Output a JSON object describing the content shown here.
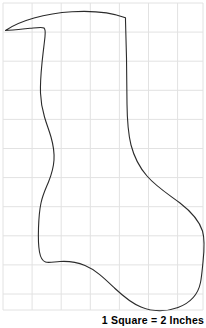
{
  "page": {
    "background_color": "#ffffff",
    "width": 206,
    "height": 328
  },
  "caption": {
    "text": "1 Square = 2 Inches",
    "color": "#000000",
    "bold": true,
    "position": "bottom-right"
  },
  "grid": {
    "line_color": "#e2e2e2",
    "line_width": 1,
    "cell_size": 29.1,
    "origin_x": 3,
    "origin_y": 3,
    "columns": 7,
    "rows": 10.6,
    "x_lines": [
      3,
      32.1,
      61.2,
      90.3,
      119.4,
      148.5,
      177.6,
      203
    ],
    "y_lines": [
      3,
      32.1,
      61.2,
      90.3,
      119.4,
      148.5,
      177.6,
      206.7,
      235.8,
      264.9,
      294,
      310
    ]
  },
  "shape": {
    "name": "christmas-stocking-outline",
    "stroke_color": "#2b2b2b",
    "stroke_width": 1.1,
    "fill": "none",
    "path": "M 5.5 30.5 C 20 20.5 45 13.5 72 11.8 C 95 10.4 113 13.2 125.5 17.8 L 125.5 20.5 L 126.5 58 L 127 104 C 127.2 120 128 133 131 145 C 134.5 158.5 140 168 147 176 C 156 186.5 168 194 180 203 C 191 211.5 199 220 202.5 231 C 205 239.5 204.3 250 203 262 C 202.2 270 201.6 277 200.5 282.5 C 198 295 190 303 178 307.5 C 166 312 152 311.5 141 307 C 131 303 123 296 115 288.5 C 105 279 96 270 85 265.5 C 76 261.8 68 261 60 261.5 C 53.5 261.9 48.5 263 45.5 262 C 42.5 261 40.5 257.5 39.5 252 C 38.3 245.5 38.2 237 38.5 228 C 38.8 219 39.5 210 41 203 C 42.8 194.5 45.8 188.5 48.5 182 C 51.3 175 53.5 168 54 160 C 54.5 151.5 53 144 51 137 C 49 130 46.5 124 44.5 117 C 42.3 109.5 40.8 102 40.5 93 C 40.2 83.5 41 73 42 63 C 43 53 44.3 43.5 45 36.5 C 45.5 31.5 45.2 29 44 28 C 42.5 26.8 38 27.5 30 28.3 C 21 29.2 12 30.2 5.5 30.5 Z"
  }
}
